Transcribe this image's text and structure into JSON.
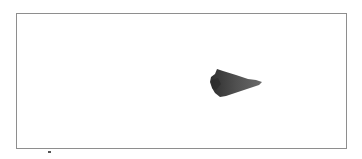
{
  "image": {
    "description": "Photograph of a dark gray stone arrowhead-like object on a white background inside a thin gray frame",
    "frame_color": "#8e8e8e",
    "object_color": "#4a4a4a",
    "background_color": "#ffffff"
  }
}
